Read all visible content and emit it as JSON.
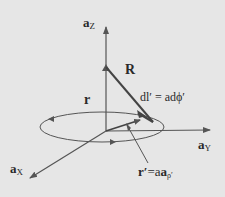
{
  "diagram": {
    "background": "#e6e6e6",
    "stroke_color": "#555555",
    "labels": {
      "az": {
        "base": "a",
        "sub": "Z"
      },
      "ay": {
        "base": "a",
        "sub": "Y"
      },
      "ax": {
        "base": "a",
        "sub": "X"
      },
      "R": "R",
      "r": "r",
      "dl": "dl′ = adϕ′",
      "rprime_lhs": "r′",
      "rprime_eq": "=a",
      "rprime_vec": "a",
      "rprime_sub": "ρ′"
    }
  }
}
